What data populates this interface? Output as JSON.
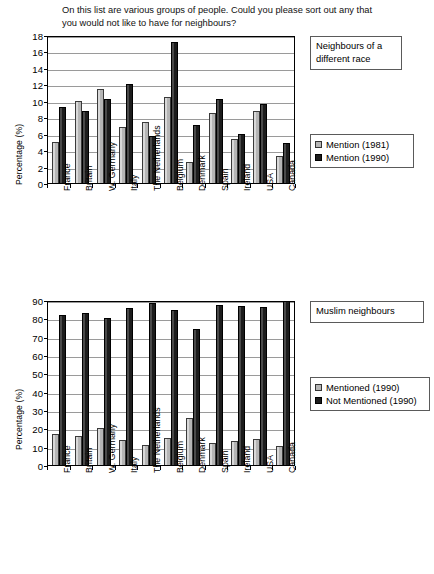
{
  "question": "On this list are various groups of people. Could you please sort out any that you would not like to have for neighbours?",
  "charts": [
    {
      "title": "Neighbours of a different race",
      "ylabel": "Percentage (%)",
      "yticks": [
        "0",
        "2",
        "4",
        "6",
        "8",
        "10",
        "12",
        "14",
        "16",
        "18"
      ],
      "legend": [
        "Mention (1981)",
        "Mention (1990)"
      ],
      "categories": [
        "France",
        "Britain",
        "W. Germany",
        "Italy",
        "The Netherlands",
        "Belgium",
        "Denmark",
        "Spain",
        "Ireland",
        "USA",
        "Canada"
      ]
    },
    {
      "title": "Muslim neighbours",
      "ylabel": "Percentage (%)",
      "yticks": [
        "0",
        "10",
        "20",
        "30",
        "40",
        "50",
        "60",
        "70",
        "80",
        "90"
      ],
      "legend": [
        "Mentioned (1990)",
        "Not Mentioned (1990)"
      ],
      "categories": [
        "France",
        "Britain",
        "W. Germany",
        "Italy",
        "The Netherlands",
        "Belgium",
        "Denmark",
        "Spain",
        "Ireland",
        "USA",
        "Canada"
      ]
    }
  ],
  "chart_data": [
    {
      "type": "bar",
      "title": "Neighbours of a different race",
      "xlabel": "",
      "ylabel": "Percentage (%)",
      "ylim": [
        0,
        18
      ],
      "ytick_step": 2,
      "grid": true,
      "legend_position": "right",
      "categories": [
        "France",
        "Britain",
        "W. Germany",
        "Italy",
        "The Netherlands",
        "Belgium",
        "Denmark",
        "Spain",
        "Ireland",
        "USA",
        "Canada"
      ],
      "series": [
        {
          "name": "Mention (1981)",
          "color": "#b5b5b5",
          "values": [
            5.0,
            10.0,
            11.4,
            6.8,
            7.4,
            10.5,
            2.6,
            8.5,
            5.4,
            8.7,
            3.3
          ]
        },
        {
          "name": "Mention (1990)",
          "color": "#1c1c1c",
          "values": [
            9.3,
            8.8,
            10.2,
            12.1,
            5.7,
            17.2,
            7.0,
            10.2,
            6.0,
            9.6,
            4.9
          ]
        }
      ]
    },
    {
      "type": "bar",
      "title": "Muslim neighbours",
      "xlabel": "",
      "ylabel": "Percentage (%)",
      "ylim": [
        0,
        90
      ],
      "ytick_step": 10,
      "grid": true,
      "legend_position": "right",
      "categories": [
        "France",
        "Britain",
        "W. Germany",
        "Italy",
        "The Netherlands",
        "Belgium",
        "Denmark",
        "Spain",
        "Ireland",
        "USA",
        "Canada"
      ],
      "series": [
        {
          "name": "Mentioned (1990)",
          "color": "#b5b5b5",
          "values": [
            17.0,
            16.0,
            20.0,
            13.5,
            11.0,
            14.5,
            25.5,
            12.0,
            13.0,
            14.0,
            10.5
          ]
        },
        {
          "name": "Not Mentioned (1990)",
          "color": "#1c1c1c",
          "values": [
            82.0,
            83.0,
            80.0,
            85.5,
            88.5,
            84.5,
            74.0,
            87.5,
            86.5,
            86.0,
            89.5
          ]
        }
      ]
    }
  ]
}
